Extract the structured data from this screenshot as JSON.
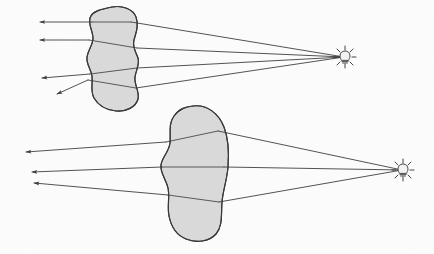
{
  "diagram": {
    "background_color": "#fdfdfd",
    "ink_color": "#3a3a3a",
    "blob_fill_color": "#d9d9d9",
    "blob_stroke_color": "#3a3a3a",
    "ray_color": "#3f3f3f",
    "scenes": [
      {
        "id": "upper-scene",
        "name": "upper-refraction-scene",
        "light_source": {
          "name": "upper-light-source",
          "icon": "light-bulb-icon",
          "x": 345,
          "y": 57,
          "ray_count": 8,
          "glow_radius": 8
        },
        "object": {
          "name": "upper-blob",
          "shape": "irregular-wavy-blob",
          "fill": "#d9d9d9",
          "center_x": 117,
          "center_y": 60,
          "width": 58,
          "height": 105,
          "path": "M 112 7 C 122 5 133 9 136 17 C 139 25 136 33 134 40 C 132 47 136 52 138 58 C 140 64 136 70 135 77 C 134 85 140 92 138 99 C 136 107 126 112 116 111 C 106 110 98 105 94 98 C 90 91 93 83 92 76 C 91 69 86 64 87 57 C 88 50 93 45 93 38 C 93 31 88 25 90 18 C 92 11 102 9 112 7 Z"
        },
        "rays": [
          {
            "name": "ray-1",
            "source_x": 345,
            "source_y": 57,
            "exit_x": 40,
            "exit_y": 22,
            "bend_in_x": 131,
            "bend_in_y": 22,
            "bend_out_x": 92,
            "bend_out_y": 22,
            "arrow": true
          },
          {
            "name": "ray-2",
            "source_x": 345,
            "source_y": 57,
            "exit_x": 40,
            "exit_y": 40,
            "bend_in_x": 137,
            "bend_in_y": 48,
            "bend_out_x": 89,
            "bend_out_y": 40,
            "arrow": true
          },
          {
            "name": "ray-3",
            "source_x": 345,
            "source_y": 57,
            "exit_x": 42,
            "exit_y": 78,
            "bend_in_x": 137,
            "bend_in_y": 68,
            "bend_out_x": 90,
            "bend_out_y": 74,
            "arrow": true
          },
          {
            "name": "ray-4",
            "source_x": 345,
            "source_y": 57,
            "exit_x": 57,
            "exit_y": 94,
            "bend_in_x": 136,
            "bend_in_y": 88,
            "bend_out_x": 88,
            "bend_out_y": 80,
            "arrow": true
          }
        ],
        "arrow_count": 4
      },
      {
        "id": "lower-scene",
        "name": "lower-refraction-scene",
        "light_source": {
          "name": "lower-light-source",
          "icon": "light-bulb-icon",
          "x": 403,
          "y": 170,
          "ray_count": 8,
          "glow_radius": 8
        },
        "object": {
          "name": "lower-blob",
          "shape": "oval-egg-blob",
          "fill": "#d9d9d9",
          "center_x": 197,
          "center_y": 173,
          "width": 64,
          "height": 135,
          "path": "M 193 106 C 207 104 219 114 224 127 C 229 140 229 154 228 167 C 227 180 223 190 222 202 C 221 214 223 226 216 234 C 209 242 196 243 186 239 C 176 235 171 226 169 216 C 167 206 170 197 168 188 C 166 179 160 173 161 165 C 162 157 169 152 170 143 C 171 134 168 124 174 116 C 180 108 186 107 193 106 Z"
        },
        "rays": [
          {
            "name": "ray-1",
            "source_x": 403,
            "source_y": 170,
            "exit_x": 26,
            "exit_y": 152,
            "bend_in_x": 218,
            "bend_in_y": 131,
            "bend_out_x": 166,
            "bend_out_y": 142,
            "arrow": true
          },
          {
            "name": "ray-2",
            "source_x": 403,
            "source_y": 170,
            "exit_x": 32,
            "exit_y": 172,
            "bend_in_x": 224,
            "bend_in_y": 167,
            "bend_out_x": 162,
            "bend_out_y": 167,
            "arrow": true
          },
          {
            "name": "ray-3",
            "source_x": 403,
            "source_y": 170,
            "exit_x": 34,
            "exit_y": 183,
            "bend_in_x": 219,
            "bend_in_y": 202,
            "bend_out_x": 168,
            "bend_out_y": 195,
            "arrow": true
          }
        ],
        "arrow_count": 3
      }
    ]
  }
}
